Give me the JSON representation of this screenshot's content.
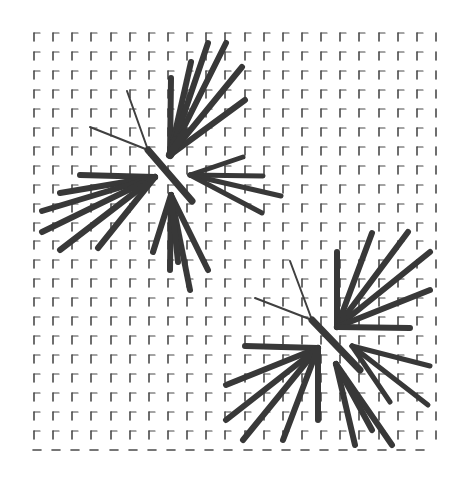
{
  "canvas": {
    "width": 464,
    "height": 479,
    "background": "#ffffff"
  },
  "colors": {
    "grid": "#4a4a4a",
    "stroke": "#383838",
    "thin": "#404040"
  },
  "grid": {
    "x0": 34,
    "y0": 33,
    "dx": 19.14,
    "dy": 18.95,
    "cols": 22,
    "rows": 23,
    "mark": "corner-gamma",
    "mark_v": 8,
    "mark_h": 6,
    "last_col": "vertical-only",
    "last_row": "horizontal-dash"
  },
  "clusters": [
    {
      "name": "upper-burst",
      "thin_lines": [
        [
          148,
          150,
          127,
          91
        ],
        [
          148,
          150,
          90,
          127
        ]
      ],
      "center_bar": [
        148,
        150,
        192,
        201
      ],
      "fans": [
        {
          "name": "fan-top-right",
          "origin": [
            170,
            155
          ],
          "width": 6,
          "tips": [
            [
              171,
              78
            ],
            [
              191,
              62
            ],
            [
              208,
              43
            ],
            [
              226,
              43
            ],
            [
              242,
              67
            ],
            [
              245,
              100
            ]
          ]
        },
        {
          "name": "fan-top-bar",
          "origin": [
            170,
            155
          ],
          "width": 8,
          "tips": [
            [
              175,
              140
            ],
            [
              185,
              132
            ]
          ]
        },
        {
          "name": "fan-left",
          "origin": [
            155,
            177
          ],
          "width": 6,
          "tips": [
            [
              80,
              175
            ],
            [
              60,
              193
            ],
            [
              42,
              211
            ],
            [
              42,
              232
            ],
            [
              60,
              250
            ],
            [
              98,
              248
            ]
          ]
        },
        {
          "name": "fan-right",
          "origin": [
            190,
            175
          ],
          "width": 5,
          "tips": [
            [
              243,
              157
            ],
            [
              263,
              176
            ],
            [
              281,
              196
            ],
            [
              262,
              213
            ]
          ]
        },
        {
          "name": "fan-bottom",
          "origin": [
            171,
            195
          ],
          "width": 6,
          "tips": [
            [
              153,
              252
            ],
            [
              170,
              270
            ],
            [
              190,
              290
            ],
            [
              208,
              270
            ],
            [
              178,
              262
            ]
          ]
        }
      ]
    },
    {
      "name": "lower-burst",
      "thin_lines": [
        [
          312,
          320,
          290,
          261
        ],
        [
          312,
          320,
          255,
          298
        ]
      ],
      "center_bar": [
        312,
        320,
        360,
        370
      ],
      "fans": [
        {
          "name": "fan-top-right",
          "origin": [
            337,
            327
          ],
          "width": 6,
          "tips": [
            [
              337,
              252
            ],
            [
              372,
              233
            ],
            [
              408,
              232
            ],
            [
              430,
              252
            ],
            [
              430,
              290
            ],
            [
              410,
              328
            ]
          ]
        },
        {
          "name": "fan-left",
          "origin": [
            318,
            348
          ],
          "width": 6,
          "tips": [
            [
              245,
              346
            ],
            [
              226,
              385
            ],
            [
              226,
              420
            ],
            [
              243,
              440
            ],
            [
              283,
              440
            ],
            [
              318,
              420
            ]
          ]
        },
        {
          "name": "fan-right",
          "origin": [
            352,
            346
          ],
          "width": 5,
          "tips": [
            [
              430,
              366
            ],
            [
              428,
              405
            ],
            [
              390,
              402
            ]
          ]
        },
        {
          "name": "fan-bottom",
          "origin": [
            336,
            364
          ],
          "width": 6,
          "tips": [
            [
              355,
              445
            ],
            [
              392,
              445
            ],
            [
              372,
              430
            ]
          ]
        }
      ]
    }
  ]
}
